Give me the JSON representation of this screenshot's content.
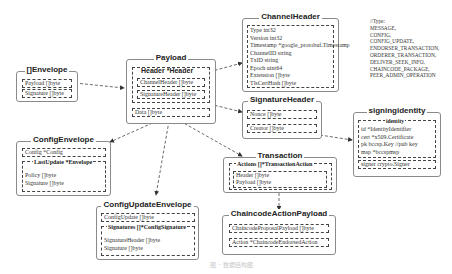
{
  "diagram": {
    "envelope": {
      "title": "[]Envelope",
      "fields": [
        "Payload []byte",
        "Signature []byte"
      ]
    },
    "payload": {
      "title": "Payload",
      "header_group": "Header *Header",
      "header_fields": [
        "ChannelHeader []byte",
        "SignatureHeader []byte"
      ],
      "data_field": "Data []byte"
    },
    "channel_header": {
      "title": "ChannelHeader",
      "fields": [
        "Type int32",
        "Version int32",
        "Timestamp *google_protobuf.Timestamp",
        "ChannelID string",
        "TxID string",
        "Epoch uint64",
        "Extension []byte",
        "TlsCertHash []byte"
      ]
    },
    "type_note": {
      "lines": [
        "//Type:",
        "MESSAGE,",
        "CONFIG,",
        "CONFIG_UPDATE,",
        "ENDORSER_TRANSACTION,",
        "ORDERER_TRANSACTION,",
        "DELIVER_SEEK_INFO,",
        "CHAINCODE_PACKAGE,",
        "PEER_ADMIN_OPERATION"
      ]
    },
    "signature_header": {
      "title": "SignatureHeader",
      "fields": [
        "Nonce []byte",
        "Creator []byte"
      ]
    },
    "signing_identity": {
      "title": "signingidentity",
      "identity_group": "identity",
      "identity_fields": [
        "id *IdentityIdentifier",
        "cert *x509.Certificate",
        "pk bccsp.Key //pub key",
        "msp *bccspmsp"
      ],
      "signer_field": "signer crypto.Signer"
    },
    "config_envelope": {
      "title": "ConfigEnvelope",
      "config_field": "Config *Config",
      "last_update_group": "LastUpdate *Envelope",
      "last_update_fields": [
        "Policy []byte",
        "Signature []byte"
      ]
    },
    "transaction": {
      "title": "Transaction",
      "actions_group": "Actions []*TransactionAction",
      "action_fields": [
        "Header []byte",
        "Payload []byte"
      ]
    },
    "config_update_envelope": {
      "title": "ConfigUpdateEnvelope",
      "config_update_field": "ConfigUpdate []byte",
      "signatures_group": "Signatures []*ConfigSignature",
      "signature_fields": [
        "SignatureHeader []byte",
        "Signature []byte"
      ]
    },
    "chaincode_action_payload": {
      "title": "ChaincodeActionPayload",
      "fields": [
        "ChaincodeProposalPayload []byte",
        "Action *ChaincodeEndorsedAction"
      ]
    },
    "caption": "图 ·· 数据结构图"
  }
}
